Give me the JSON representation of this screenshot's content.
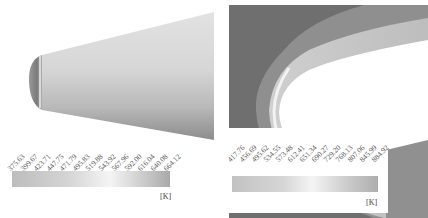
{
  "figure": {
    "left_panel": {
      "title": "Surface temperature contour",
      "legend": {
        "ticks": [
          "375.63",
          "399.67",
          "423.71",
          "447.75",
          "471.79",
          "495.83",
          "519.88",
          "543.92",
          "567.96",
          "592.00",
          "616.04",
          "640.08",
          "664.12"
        ],
        "unit": "[K]",
        "min": 375.63,
        "max": 664.12
      }
    },
    "right_panel": {
      "title": "Flow field temperature contour",
      "legend": {
        "ticks": [
          "417.76",
          "456.69",
          "495.62",
          "534.55",
          "573.48",
          "612.41",
          "651.34",
          "690.27",
          "729.20",
          "768.13",
          "807.06",
          "845.99",
          "884.92"
        ],
        "unit": "[K]",
        "min": 417.76,
        "max": 884.92
      }
    },
    "colors": {
      "background": "#ffffff",
      "body_light": "#cfcfcf",
      "body_dark": "#8a8a8a",
      "field_dark": "#6e6e6e",
      "shock_layer": "#b5b5b5"
    }
  }
}
